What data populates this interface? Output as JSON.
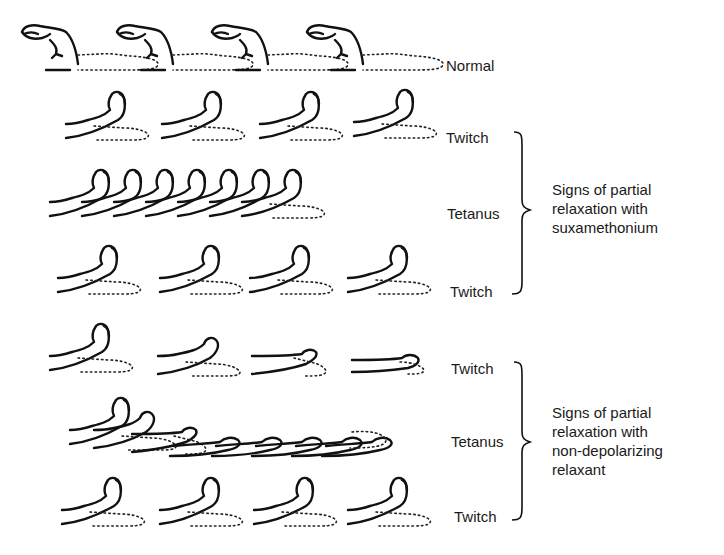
{
  "figure": {
    "rows": [
      {
        "id": "normal",
        "label": "Normal",
        "hand_count": 4,
        "pose": "flexed-normal"
      },
      {
        "id": "sux-twitch-1",
        "label": "Twitch",
        "hand_count": 4,
        "pose": "upright"
      },
      {
        "id": "sux-tetanus",
        "label": "Tetanus",
        "hand_count": 7,
        "pose": "upright-sustained"
      },
      {
        "id": "sux-twitch-2",
        "label": "Twitch",
        "hand_count": 4,
        "pose": "upright"
      },
      {
        "id": "ndr-twitch-1",
        "label": "Twitch",
        "hand_count": 4,
        "pose": "fading"
      },
      {
        "id": "ndr-tetanus",
        "label": "Tetanus",
        "hand_count": 8,
        "pose": "fading-sustained"
      },
      {
        "id": "ndr-twitch-2",
        "label": "Twitch",
        "hand_count": 4,
        "pose": "upright"
      }
    ],
    "groups": [
      {
        "id": "suxamethonium",
        "lines": [
          "Signs of partial",
          "relaxation with",
          "suxamethonium"
        ]
      },
      {
        "id": "non-depolarizing",
        "lines": [
          "Signs of partial",
          "relaxation with",
          "non-depolarizing",
          "relaxant"
        ]
      }
    ]
  }
}
